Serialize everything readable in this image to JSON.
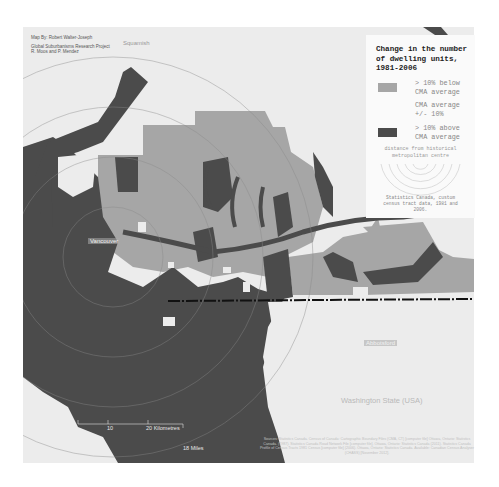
{
  "credits": {
    "line1": "Map By: Robert Walter-Joseph",
    "line2": "Global Suburbanisms Research Project",
    "line3": "R. Moos and P. Mendez"
  },
  "places": {
    "squamish": "Squamish",
    "vancouver": "Vancouver",
    "abbotsford": "Abbotsford",
    "washington": "Washington State (USA)"
  },
  "legend": {
    "title": "Change in the number of dwelling units, 1981-2006",
    "items": [
      {
        "label": "> 10% below CMA average",
        "color": "#a6a6a6"
      },
      {
        "label": "CMA average +/- 10%",
        "color": "#ececec"
      },
      {
        "label": "> 10% above CMA average",
        "color": "#4b4b4b"
      }
    ],
    "distance_label": "distance from historical metropolitan centre",
    "rings": [
      "10km",
      "20km",
      "30km",
      "40km",
      "50km"
    ],
    "source": "Statistics Canada, custom census tract data, 1981 and 2006."
  },
  "scale": {
    "km_10": "10",
    "km_20": "20 Kilometres",
    "miles": "18 Miles"
  },
  "sources_text": "Sources: Statistics Canada. Census of Canada: Cartographic Boundary Files (CMA, CT) [computer file] Ottawa, Ontario: Statistics Canada. (1987). Statistics Canada Road Network File [computer file]. Ottawa, Ontario: Statistics Canada (2011). Statistics Canada Profile of Census Tracts 1981 Census [computer file] (2006). Ottawa, Ontario: Statistics Canada. Available: Canadian Census Analyser (CHASS) [November 2012].",
  "colors": {
    "background": "#ffffff",
    "land": "#ececec",
    "below": "#a6a6a6",
    "average": "#ececec",
    "above": "#4b4b4b",
    "water": "#4b4b4b"
  }
}
